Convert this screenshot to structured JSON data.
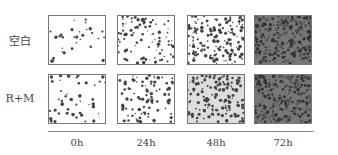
{
  "figure": {
    "rows": [
      {
        "label": "空白",
        "panels": [
          {
            "time": "0h",
            "bg": "#ffffff",
            "density": 30
          },
          {
            "time": "24h",
            "bg": "#ffffff",
            "density": 90
          },
          {
            "time": "48h",
            "bg": "#ffffff",
            "density": 160
          },
          {
            "time": "72h",
            "bg": "#777777",
            "density": 260
          }
        ]
      },
      {
        "label": "R+M",
        "panels": [
          {
            "time": "0h",
            "bg": "#ffffff",
            "density": 45
          },
          {
            "time": "24h",
            "bg": "#ffffff",
            "density": 90
          },
          {
            "time": "48h",
            "bg": "#dddddd",
            "density": 150
          },
          {
            "time": "72h",
            "bg": "#777777",
            "density": 240
          }
        ]
      }
    ],
    "time_labels": [
      "0h",
      "24h",
      "48h",
      "72h"
    ]
  }
}
